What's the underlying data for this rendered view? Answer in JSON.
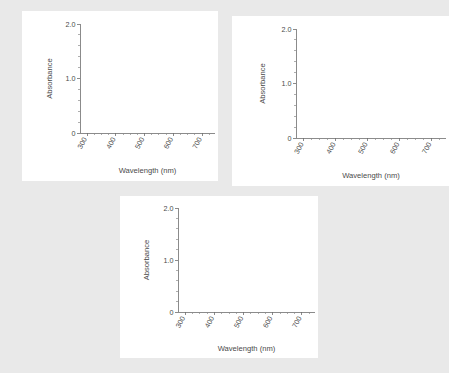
{
  "page": {
    "background_color": "#e9e9e9",
    "panel_color": "#ffffff",
    "axis_color": "#6e6e6e",
    "text_color": "#4a4a4a"
  },
  "figures": [
    {
      "id": "panel-1",
      "position": "top-left",
      "chart_data": {
        "type": "line",
        "title": "",
        "subtitle": "",
        "xlabel": "Wavelength (nm)",
        "ylabel": "Absorbance",
        "xlim": [
          275,
          745
        ],
        "ylim": [
          0,
          2.0
        ],
        "x_major_ticks": [
          300,
          400,
          500,
          600,
          700
        ],
        "x_major_tick_labels": [
          "300",
          "400",
          "500",
          "600",
          "700"
        ],
        "x_minor_tick_step": 25,
        "y_major_ticks": [
          0,
          1.0,
          2.0
        ],
        "y_major_tick_labels": [
          "0",
          "1.0",
          "2.0"
        ],
        "y_minor_tick_step": 0.2,
        "grid": false,
        "legend": null,
        "series": [
          {
            "name": "Absorbance spectrum",
            "x": [],
            "y": []
          }
        ],
        "annotations": [],
        "note": "empty plot - no data plotted"
      }
    },
    {
      "id": "panel-2",
      "position": "top-right",
      "chart_data": {
        "type": "line",
        "title": "",
        "subtitle": "",
        "xlabel": "Wavelength (nm)",
        "ylabel": "Absorbance",
        "xlim": [
          275,
          745
        ],
        "ylim": [
          0,
          2.0
        ],
        "x_major_ticks": [
          300,
          400,
          500,
          600,
          700
        ],
        "x_major_tick_labels": [
          "300",
          "400",
          "500",
          "600",
          "700"
        ],
        "x_minor_tick_step": 25,
        "y_major_ticks": [
          0,
          1.0,
          2.0
        ],
        "y_major_tick_labels": [
          "0",
          "1.0",
          "2.0"
        ],
        "y_minor_tick_step": 0.2,
        "grid": false,
        "legend": null,
        "series": [
          {
            "name": "Absorbance spectrum",
            "x": [],
            "y": []
          }
        ],
        "annotations": [],
        "note": "empty plot - no data plotted"
      }
    },
    {
      "id": "panel-3",
      "position": "bottom-center",
      "chart_data": {
        "type": "line",
        "title": "",
        "subtitle": "",
        "xlabel": "Wavelength (nm)",
        "ylabel": "Absorbance",
        "xlim": [
          275,
          745
        ],
        "ylim": [
          0,
          2.0
        ],
        "x_major_ticks": [
          300,
          400,
          500,
          600,
          700
        ],
        "x_major_tick_labels": [
          "300",
          "400",
          "500",
          "600",
          "700"
        ],
        "x_minor_tick_step": 25,
        "y_major_ticks": [
          0,
          1.0,
          2.0
        ],
        "y_major_tick_labels": [
          "0",
          "1.0",
          "2.0"
        ],
        "y_minor_tick_step": 0.2,
        "grid": false,
        "legend": null,
        "series": [
          {
            "name": "Absorbance spectrum",
            "x": [],
            "y": []
          }
        ],
        "annotations": [],
        "note": "empty plot - no data plotted"
      }
    }
  ]
}
